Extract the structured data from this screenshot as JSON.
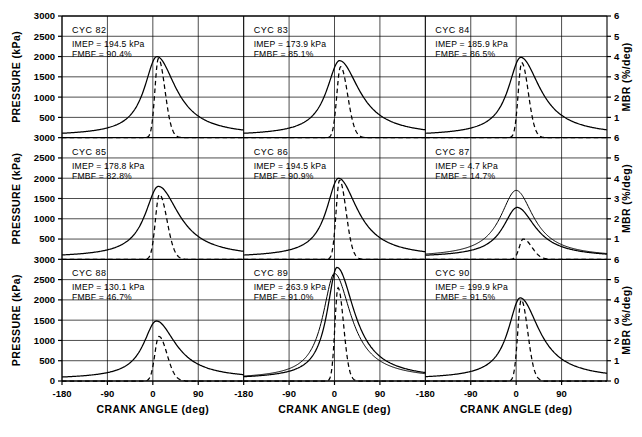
{
  "figure": {
    "left_axis_title": "PRESSURE (kPa)",
    "right_axis_title": "MBR (%/deg)",
    "x_axis_title": "CRANK ANGLE (deg)"
  },
  "chart_data": {
    "type": "line",
    "title": "",
    "xlabel": "CRANK ANGLE (deg)",
    "ylabel": "PRESSURE (kPa)",
    "y2label": "MBR (%/deg)",
    "xlim": [
      -180,
      180
    ],
    "ylim": [
      0,
      3000
    ],
    "y2lim": [
      0,
      6
    ],
    "xticks": [
      -180,
      -90,
      0,
      90
    ],
    "yticks": [
      0,
      500,
      1000,
      1500,
      2000,
      2500,
      3000
    ],
    "y2ticks": [
      0,
      1,
      2,
      3,
      4,
      5,
      6
    ],
    "grid": true,
    "legend": "none",
    "layout": {
      "rows": 3,
      "cols": 3
    },
    "series_styles": [
      {
        "name": "pressure",
        "style": "solid",
        "axis": "left"
      },
      {
        "name": "mass burn rate",
        "style": "dashed",
        "axis": "right"
      },
      {
        "name": "motored pressure",
        "style": "solid",
        "axis": "left"
      }
    ],
    "panels": [
      {
        "cycle_label": "CYC",
        "cycle_number": "82",
        "imep_text": "IMEP = 194.5 kPa",
        "fmbf_text": "FMBF = 90.4%",
        "imep": 194.5,
        "fmbf": 90.4,
        "pressure_peak": 2000,
        "pressure_peak_angle": 8,
        "pressure_rise": 30,
        "pressure_decay": 46,
        "mbr_peak": 3.9,
        "mbr_peak_angle": 11,
        "mbr_width": 13,
        "mbr_skew": 1.9,
        "motored": false,
        "motored_peak": 0
      },
      {
        "cycle_label": "CYC",
        "cycle_number": "83",
        "imep_text": "IMEP = 173.9 kPa",
        "fmbf_text": "FMBF = 85.1%",
        "imep": 173.9,
        "fmbf": 85.1,
        "pressure_peak": 1900,
        "pressure_peak_angle": 10,
        "pressure_rise": 31,
        "pressure_decay": 48,
        "mbr_peak": 3.5,
        "mbr_peak_angle": 12,
        "mbr_width": 14,
        "mbr_skew": 1.9,
        "motored": false,
        "motored_peak": 0
      },
      {
        "cycle_label": "CYC",
        "cycle_number": "84",
        "imep_text": "IMEP = 185.9 kPa",
        "fmbf_text": "FMBF = 86.5%",
        "imep": 185.9,
        "fmbf": 86.5,
        "pressure_peak": 1980,
        "pressure_peak_angle": 9,
        "pressure_rise": 30,
        "pressure_decay": 47,
        "mbr_peak": 3.7,
        "mbr_peak_angle": 11,
        "mbr_width": 13,
        "mbr_skew": 1.9,
        "motored": false,
        "motored_peak": 0
      },
      {
        "cycle_label": "CYC",
        "cycle_number": "85",
        "imep_text": "IMEP = 178.8 kPa",
        "fmbf_text": "FMBF = 82.8%",
        "imep": 178.8,
        "fmbf": 82.8,
        "pressure_peak": 1800,
        "pressure_peak_angle": 11,
        "pressure_rise": 32,
        "pressure_decay": 50,
        "mbr_peak": 3.2,
        "mbr_peak_angle": 13,
        "mbr_width": 15,
        "mbr_skew": 1.9,
        "motored": false,
        "motored_peak": 0
      },
      {
        "cycle_label": "CYC",
        "cycle_number": "86",
        "imep_text": "IMEP = 194.5 kPa",
        "fmbf_text": "FMBF = 90.9%",
        "imep": 194.5,
        "fmbf": 90.9,
        "pressure_peak": 2000,
        "pressure_peak_angle": 8,
        "pressure_rise": 29,
        "pressure_decay": 46,
        "mbr_peak": 3.9,
        "mbr_peak_angle": 10,
        "mbr_width": 13,
        "mbr_skew": 1.9,
        "motored": false,
        "motored_peak": 0
      },
      {
        "cycle_label": "CYC",
        "cycle_number": "87",
        "imep_text": "IMEP = 4.7 kPa",
        "fmbf_text": "FMBF = 14.7%",
        "imep": 4.7,
        "fmbf": 14.7,
        "pressure_peak": 1280,
        "pressure_peak_angle": 2,
        "pressure_rise": 34,
        "pressure_decay": 44,
        "mbr_peak": 1.0,
        "mbr_peak_angle": 14,
        "mbr_width": 17,
        "mbr_skew": 2.2,
        "motored": true,
        "motored_peak": 1700
      },
      {
        "cycle_label": "CYC",
        "cycle_number": "88",
        "imep_text": "IMEP = 130.1 kPa",
        "fmbf_text": "FMBF = 46.7%",
        "imep": 130.1,
        "fmbf": 46.7,
        "pressure_peak": 1480,
        "pressure_peak_angle": 7,
        "pressure_rise": 31,
        "pressure_decay": 47,
        "mbr_peak": 2.2,
        "mbr_peak_angle": 12,
        "mbr_width": 16,
        "mbr_skew": 2.0,
        "motored": false,
        "motored_peak": 0
      },
      {
        "cycle_label": "CYC",
        "cycle_number": "89",
        "imep_text": "IMEP = 263.9 kPa",
        "fmbf_text": "FMBF = 91.0%",
        "imep": 263.9,
        "fmbf": 91.0,
        "pressure_peak": 2800,
        "pressure_peak_angle": 5,
        "pressure_rise": 24,
        "pressure_decay": 42,
        "mbr_peak": 4.6,
        "mbr_peak_angle": 7,
        "mbr_width": 11,
        "mbr_skew": 1.8,
        "motored": true,
        "motored_peak": 2650
      },
      {
        "cycle_label": "CYC",
        "cycle_number": "90",
        "imep_text": "IMEP = 199.9 kPa",
        "fmbf_text": "FMBF = 91.5%",
        "imep": 199.9,
        "fmbf": 91.5,
        "pressure_peak": 2050,
        "pressure_peak_angle": 8,
        "pressure_rise": 29,
        "pressure_decay": 46,
        "mbr_peak": 4.0,
        "mbr_peak_angle": 10,
        "mbr_width": 13,
        "mbr_skew": 1.9,
        "motored": false,
        "motored_peak": 0
      }
    ]
  }
}
